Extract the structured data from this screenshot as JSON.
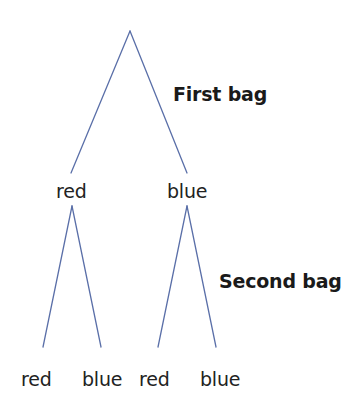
{
  "diagram": {
    "type": "probability-tree",
    "line_color": "#5a6fa8",
    "text_color": "#222222",
    "stages": [
      {
        "label": "First bag"
      },
      {
        "label": "Second bag"
      }
    ],
    "root": {
      "children": [
        {
          "label": "red",
          "children": [
            {
              "label": "red"
            },
            {
              "label": "blue"
            }
          ]
        },
        {
          "label": "blue",
          "children": [
            {
              "label": "red"
            },
            {
              "label": "blue"
            }
          ]
        }
      ]
    }
  }
}
